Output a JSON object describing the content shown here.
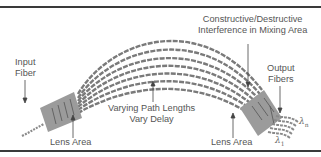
{
  "diagram": {
    "labels": {
      "input_fiber": [
        "Input",
        "Fiber"
      ],
      "lens_area_left": "Lens Area",
      "lens_area_right": "Lens Area",
      "varying_path": [
        "Varying Path Lengths",
        "Vary Delay"
      ],
      "interference": [
        "Constructive/Destructive",
        "Interference in Mixing Area"
      ],
      "output_fibers": [
        "Output",
        "Fibers"
      ],
      "lambda_n": "λ",
      "lambda_n_sub": "n",
      "lambda_1": "λ",
      "lambda_1_sub": "1"
    },
    "arc_fiber_count": 7,
    "output_fiber_count": 5,
    "colors": {
      "rule": "#3a3a3a",
      "lens": "#9a9a9a",
      "fiber": "#7a7a7a",
      "text": "#555555"
    }
  }
}
